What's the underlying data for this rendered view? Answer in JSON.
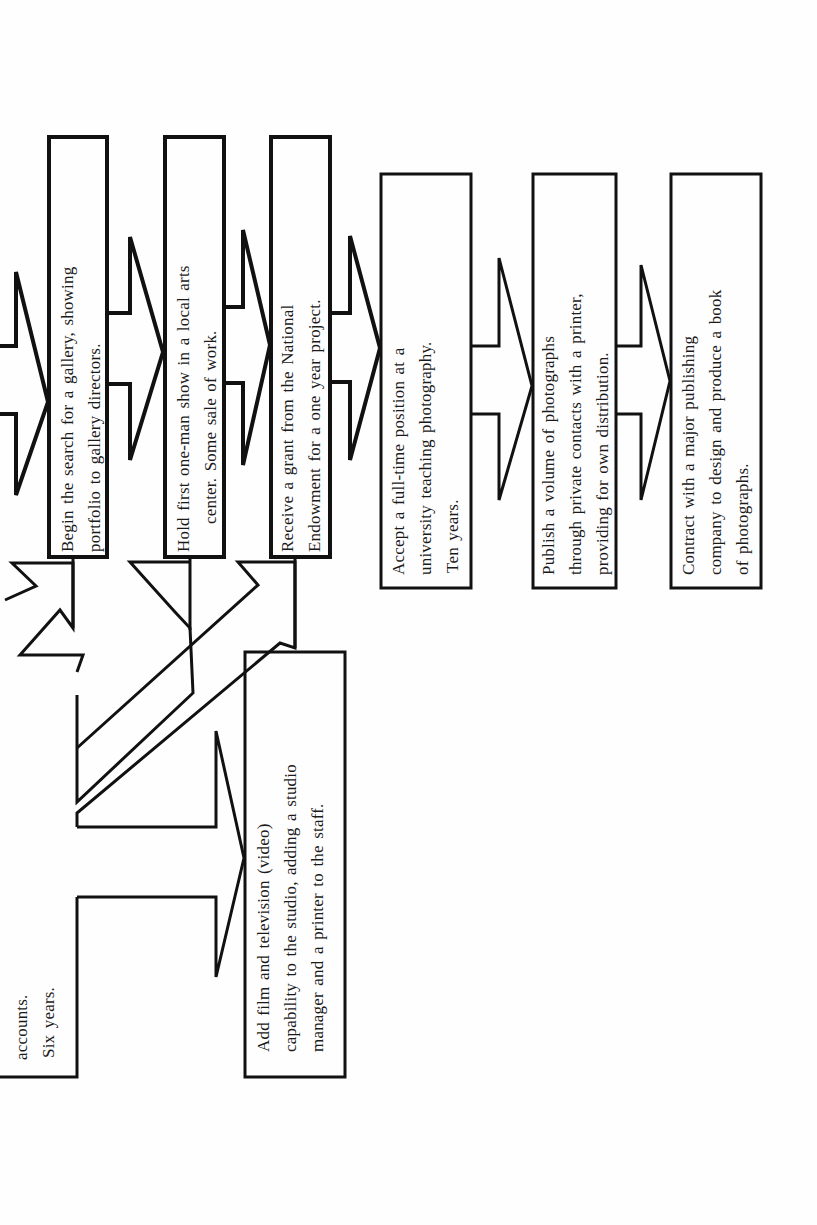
{
  "diagram": {
    "orientation": "rotated -90deg (reads bottom-to-top)",
    "stroke_color": "#111111",
    "background_color": "#fefefe",
    "partial_box": {
      "lines": [
        "accounts.",
        "Six years."
      ]
    },
    "boxes": [
      {
        "id": "box-gallery-search",
        "lines": [
          "Begin the search for a gallery, showing",
          "portfolio to gallery directors."
        ]
      },
      {
        "id": "box-one-man-show",
        "lines": [
          "Hold first one-man show in a local arts",
          "center. Some sale of work."
        ]
      },
      {
        "id": "box-grant",
        "lines": [
          "Receive a grant from the National",
          "Endowment for a one year project."
        ]
      },
      {
        "id": "box-teaching",
        "lines": [
          "Accept a full-time position at a",
          "university teaching photography.",
          "Ten years."
        ]
      },
      {
        "id": "box-publish-volume",
        "lines": [
          "Publish a volume of photographs",
          "through private contacts with a printer,",
          "providing for own distribution."
        ]
      },
      {
        "id": "box-book-contract",
        "lines": [
          "Contract with a major publishing",
          "company to design and produce a book",
          "of photographs."
        ]
      },
      {
        "id": "box-film-video",
        "lines": [
          "Add film and television (video)",
          "capability to the studio, adding a studio",
          "manager and a printer to the staff."
        ]
      }
    ],
    "connections": [
      {
        "from": "off-page",
        "to": "box-gallery-search",
        "type": "arrow"
      },
      {
        "from": "box-gallery-search",
        "to": "box-one-man-show",
        "type": "arrow"
      },
      {
        "from": "box-one-man-show",
        "to": "box-grant",
        "type": "arrow"
      },
      {
        "from": "box-grant",
        "to": "box-teaching",
        "type": "arrow"
      },
      {
        "from": "box-teaching",
        "to": "box-publish-volume",
        "type": "arrow"
      },
      {
        "from": "box-publish-volume",
        "to": "box-book-contract",
        "type": "arrow"
      },
      {
        "from": "partial_box",
        "to": "box-film-video",
        "type": "arrow"
      },
      {
        "from": "box-film-video",
        "to": "box-gallery-search",
        "type": "diagonal-arrow"
      },
      {
        "from": "box-film-video",
        "to": "box-one-man-show",
        "type": "diagonal-arrow"
      },
      {
        "from": "box-film-video",
        "to": "box-grant",
        "type": "diagonal-arrow"
      }
    ]
  }
}
